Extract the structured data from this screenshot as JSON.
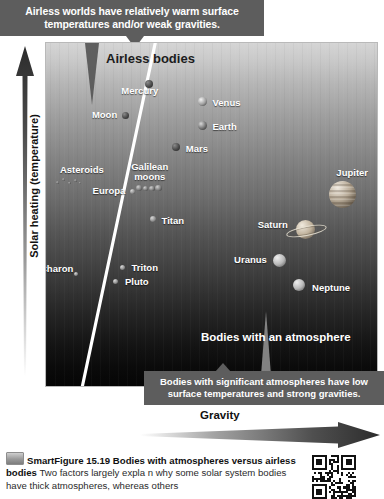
{
  "callouts": {
    "top": "Airless worlds have relatively warm surface temperatures and/or weak gravities.",
    "bottom": "Bodies with significant atmospheres have low surface temperatures and strong gravities."
  },
  "plot": {
    "zone_airless": "Airless bodies",
    "zone_atmosphere": "Bodies with an atmosphere",
    "background_top_color": "#d5d5d5",
    "background_bottom_color": "#050505",
    "divider_color": "#ffffff"
  },
  "axes": {
    "y_label": "Solar heating (temperature)",
    "x_label": "Gravity",
    "y_direction": "up",
    "x_direction": "right"
  },
  "caption": {
    "title": "SmartFigure 15.19",
    "subtitle": "Bodies with atmospheres versus airless bodies",
    "text": "Two factors largely expla n why some solar system bodies have thick atmospheres, whereas others"
  },
  "chart_data": {
    "type": "scatter",
    "title": "Bodies with atmospheres versus airless bodies",
    "xlabel": "Gravity",
    "ylabel": "Solar heating (temperature)",
    "xlim": [
      0,
      100
    ],
    "ylim": [
      0,
      100
    ],
    "grid": false,
    "legend": null,
    "annotations": [
      "Airless bodies",
      "Bodies with an atmosphere",
      "Airless worlds have relatively warm surface temperatures and/or weak gravities.",
      "Bodies with significant atmospheres have low surface temperatures and strong gravities."
    ],
    "divider": {
      "description": "diagonal boundary separating airless bodies (upper-left) from bodies with an atmosphere (lower-right)",
      "x1": 33,
      "y1": 0,
      "x2": 11,
      "y2": 100
    },
    "points": [
      {
        "name": "Mercury",
        "x": 31,
        "y": 88,
        "size": 8,
        "label_dx": -28,
        "label_dy": 7,
        "kind": "rocky"
      },
      {
        "name": "Venus",
        "x": 47,
        "y": 83,
        "size": 9,
        "label_dx": 10,
        "label_dy": 1,
        "kind": "cloudy"
      },
      {
        "name": "Moon",
        "x": 24,
        "y": 79,
        "size": 7,
        "label_dx": -34,
        "label_dy": 0,
        "kind": "rocky"
      },
      {
        "name": "Earth",
        "x": 47,
        "y": 76,
        "size": 9,
        "label_dx": 10,
        "label_dy": 1,
        "kind": "earth"
      },
      {
        "name": "Mars",
        "x": 39,
        "y": 70,
        "size": 8,
        "label_dx": 10,
        "label_dy": 2,
        "kind": "rocky"
      },
      {
        "name": "Asteroids",
        "x": 6,
        "y": 60,
        "size": 3,
        "label_dx": -6,
        "label_dy": -11,
        "kind": "asteroids"
      },
      {
        "name": "Galilean moons",
        "x": 31,
        "y": 58,
        "size": 5,
        "label_dx": -18,
        "label_dy": -20,
        "kind": "moons"
      },
      {
        "name": "Europa",
        "x": 26,
        "y": 57,
        "size": 5,
        "label_dx": -40,
        "label_dy": 0,
        "kind": "icy"
      },
      {
        "name": "Titan",
        "x": 32,
        "y": 49,
        "size": 6,
        "label_dx": 9,
        "label_dy": 2,
        "kind": "icy"
      },
      {
        "name": "Charon",
        "x": 9,
        "y": 33,
        "size": 4,
        "label_dx": -36,
        "label_dy": -5,
        "kind": "icy"
      },
      {
        "name": "Triton",
        "x": 23,
        "y": 35,
        "size": 5,
        "label_dx": 9,
        "label_dy": 1,
        "kind": "icy"
      },
      {
        "name": "Pluto",
        "x": 21,
        "y": 31,
        "size": 5,
        "label_dx": 9,
        "label_dy": 1,
        "kind": "icy"
      },
      {
        "name": "Jupiter",
        "x": 89,
        "y": 56,
        "size": 27,
        "label_dx": -6,
        "label_dy": -22,
        "kind": "gas-banded"
      },
      {
        "name": "Saturn",
        "x": 78,
        "y": 46,
        "size": 19,
        "label_dx": -48,
        "label_dy": -4,
        "kind": "ringed"
      },
      {
        "name": "Uranus",
        "x": 70,
        "y": 37,
        "size": 13,
        "label_dx": -45,
        "label_dy": 0,
        "kind": "ice-giant"
      },
      {
        "name": "Neptune",
        "x": 76,
        "y": 30,
        "size": 12,
        "label_dx": 13,
        "label_dy": 3,
        "kind": "ice-giant"
      }
    ]
  }
}
